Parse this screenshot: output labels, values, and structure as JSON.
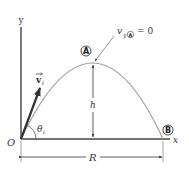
{
  "figure": {
    "type": "projectile-motion-diagram",
    "axes": {
      "x_label": "x",
      "y_label": "y",
      "origin_label": "O"
    },
    "vector": {
      "name": "v",
      "subscript": "i",
      "label_display": "v⃗ᵢ"
    },
    "angle": {
      "symbol": "θ",
      "subscript": "i"
    },
    "points": {
      "peak": {
        "label": "A"
      },
      "landing": {
        "label": "B"
      }
    },
    "annotation": {
      "text_prefix": "v",
      "text_sub": "y",
      "text_circ": "A",
      "text_suffix": "= 0"
    },
    "height": {
      "label": "h"
    },
    "range": {
      "label": "R"
    },
    "colors": {
      "axis": "#333333",
      "trajectory": "#9a9a9a",
      "vector": "#333333",
      "text": "#333333"
    }
  }
}
